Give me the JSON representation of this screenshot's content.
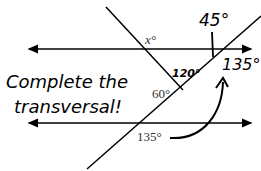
{
  "diagram": {
    "labels": {
      "x_angle": "x°",
      "angle_120": "120°",
      "angle_60": "60°",
      "angle_135_bottom": "135°",
      "angle_135_top": "135°",
      "angle_45": "45°"
    },
    "handwritten_text": {
      "line1": "Complete the",
      "line2": "transversal!"
    },
    "colors": {
      "line": "#000000",
      "printed_text": "#333333",
      "background": "#ffffff"
    }
  }
}
